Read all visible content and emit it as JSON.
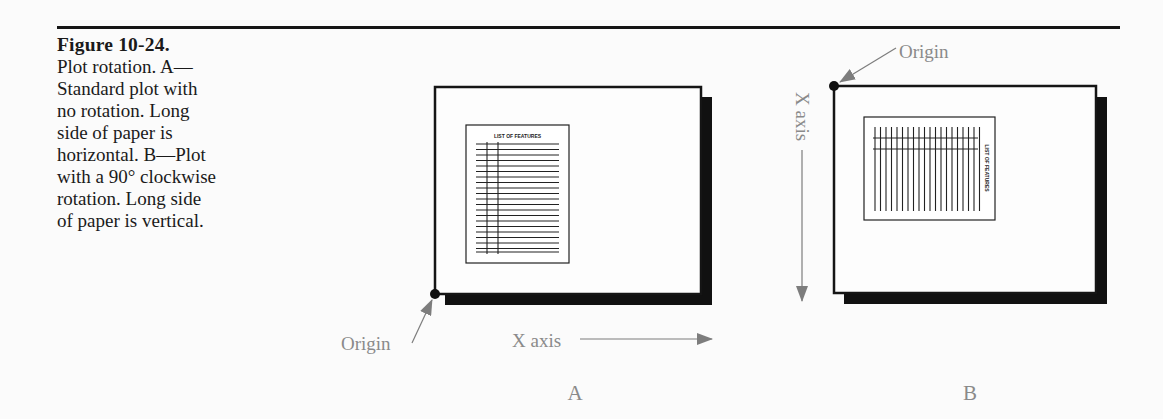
{
  "caption": {
    "title": "Figure 10-24.",
    "lines": [
      "Plot rotation. A—",
      "Standard plot with",
      "no rotation. Long",
      "side of paper is",
      "horizontal. B—Plot",
      "with a 90° clockwise",
      "rotation. Long side",
      "of paper is vertical."
    ]
  },
  "panels": [
    {
      "id": "A",
      "label": "A",
      "origin_label": "Origin",
      "axis_label": "X axis",
      "document_title": "LIST OF FEATURES",
      "orientation": "landscape, no rotation"
    },
    {
      "id": "B",
      "label": "B",
      "origin_label": "Origin",
      "axis_label": "X axis",
      "document_title": "LIST OF FEATURES",
      "orientation": "rotated 90° clockwise"
    }
  ],
  "colors": {
    "ink": "#151515",
    "label_gray": "#8a8a8a",
    "arrow_gray": "#7d7d7d",
    "background": "#fbfbfb"
  }
}
